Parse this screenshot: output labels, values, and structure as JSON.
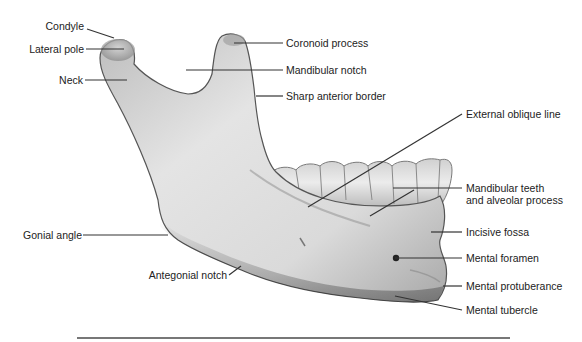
{
  "figure": {
    "colors": {
      "bone_light": "#e8e8e8",
      "bone_mid": "#c8c8c8",
      "bone_dark": "#6a6a6a",
      "line": "#333333",
      "text": "#222222",
      "rule": "#777777"
    }
  },
  "labels_left": [
    {
      "id": "condyle",
      "text": "Condyle"
    },
    {
      "id": "lateral-pole",
      "text": "Lateral pole"
    },
    {
      "id": "neck",
      "text": "Neck"
    },
    {
      "id": "gonial-angle",
      "text": "Gonial angle"
    },
    {
      "id": "antegonial-notch",
      "text": "Antegonial notch"
    }
  ],
  "labels_right": [
    {
      "id": "coronoid-process",
      "text": "Coronoid process"
    },
    {
      "id": "mandibular-notch",
      "text": "Mandibular notch"
    },
    {
      "id": "sharp-anterior-border",
      "text": "Sharp anterior border"
    },
    {
      "id": "external-oblique-line",
      "text": "External oblique line"
    },
    {
      "id": "mandibular-teeth",
      "text": "Mandibular teeth",
      "text2": "and alveolar process"
    },
    {
      "id": "incisive-fossa",
      "text": "Incisive fossa"
    },
    {
      "id": "mental-foramen",
      "text": "Mental foramen"
    },
    {
      "id": "mental-protuberance",
      "text": "Mental protuberance"
    },
    {
      "id": "mental-tubercle",
      "text": "Mental tubercle"
    }
  ]
}
